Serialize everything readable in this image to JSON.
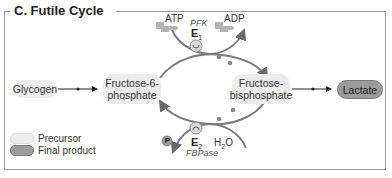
{
  "title": "C. Futile Cycle",
  "nodes": {
    "glycogen": "Glycogen",
    "f6p_line1": "Fructose-6-",
    "f6p_line2": "phosphate",
    "fbp_line1": "Fructose-",
    "fbp_line2": "bisphosphate",
    "lactate": "Lactate"
  },
  "upper_reaction": {
    "substrate": "ATP",
    "product": "ADP",
    "enzyme_name": "PFK",
    "enzyme_label": "E",
    "enzyme_sub": "1"
  },
  "lower_reaction": {
    "substrate": "H",
    "substrate_sub": "2",
    "substrate_tail": "O",
    "product": "P",
    "enzyme_name": "FBPase",
    "enzyme_label": "E",
    "enzyme_sub": "2"
  },
  "legend": [
    {
      "label": "Precursor",
      "color": "#ececec"
    },
    {
      "label": "Final product",
      "color": "#9c9c9c"
    }
  ],
  "colors": {
    "frame": "#9a9a9a",
    "arrow": "#7a7a7a",
    "precursor": "#ececec",
    "final_product": "#9c9c9c"
  }
}
